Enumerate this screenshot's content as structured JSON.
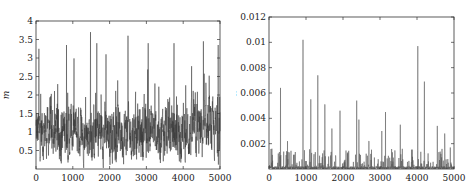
{
  "chart_data": [
    {
      "type": "line",
      "title": "",
      "xlabel": "",
      "ylabel": "m",
      "xlim": [
        0,
        5000
      ],
      "ylim": [
        0,
        4
      ],
      "xticks": [
        "0",
        "1000",
        "2000",
        "3000",
        "4000",
        "5000"
      ],
      "yticks": [
        "0.5",
        "1",
        "1.5",
        "2",
        "2.5",
        "3",
        "3.5",
        "4"
      ],
      "grid": false,
      "legend": null,
      "series": [
        {
          "name": "m trace",
          "description": "MCMC trace fluctuating mostly between 0.2 and 2.5, centered near 1.0, with spikes up to ~3.7",
          "mean": 1.05,
          "min": 0.05,
          "max": 3.7,
          "peaks": [
            {
              "x": 80,
              "y": 3.25
            },
            {
              "x": 830,
              "y": 3.35
            },
            {
              "x": 1480,
              "y": 3.7
            },
            {
              "x": 1650,
              "y": 3.4
            },
            {
              "x": 1900,
              "y": 3.1
            },
            {
              "x": 2500,
              "y": 3.6
            },
            {
              "x": 3050,
              "y": 3.4
            },
            {
              "x": 3750,
              "y": 3.4
            },
            {
              "x": 4550,
              "y": 3.45
            },
            {
              "x": 4950,
              "y": 3.35
            }
          ]
        }
      ]
    },
    {
      "type": "line",
      "title": "",
      "xlabel": "",
      "ylabel": "λ",
      "xlim": [
        0,
        5000
      ],
      "ylim": [
        0,
        0.012
      ],
      "xticks": [
        "0",
        "1000",
        "2000",
        "3000",
        "4000",
        "5000"
      ],
      "yticks": [
        "0.002",
        "0.004",
        "0.006",
        "0.008",
        "0.01",
        "0.012"
      ],
      "grid": false,
      "legend": null,
      "series": [
        {
          "name": "lambda trace",
          "description": "MCMC trace mostly near 0 with sparse spikes",
          "peaks": [
            {
              "x": 80,
              "y": 0.0016
            },
            {
              "x": 310,
              "y": 0.0064
            },
            {
              "x": 500,
              "y": 0.0022
            },
            {
              "x": 920,
              "y": 0.0102
            },
            {
              "x": 1130,
              "y": 0.0055
            },
            {
              "x": 1320,
              "y": 0.0074
            },
            {
              "x": 1510,
              "y": 0.0051
            },
            {
              "x": 1700,
              "y": 0.0032
            },
            {
              "x": 1920,
              "y": 0.0046
            },
            {
              "x": 2370,
              "y": 0.0054
            },
            {
              "x": 2430,
              "y": 0.0039
            },
            {
              "x": 2700,
              "y": 0.0022
            },
            {
              "x": 3050,
              "y": 0.003
            },
            {
              "x": 3150,
              "y": 0.0045
            },
            {
              "x": 3550,
              "y": 0.0035
            },
            {
              "x": 4020,
              "y": 0.0097
            },
            {
              "x": 4200,
              "y": 0.0069
            },
            {
              "x": 4550,
              "y": 0.0034
            },
            {
              "x": 4750,
              "y": 0.0028
            },
            {
              "x": 4900,
              "y": 0.0017
            }
          ]
        }
      ]
    }
  ]
}
